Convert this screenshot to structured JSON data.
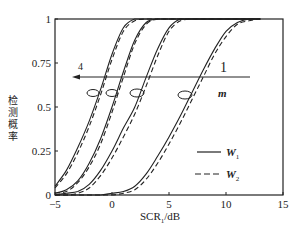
{
  "chart_data": {
    "type": "line",
    "title": "",
    "xlabel": "SCR_1/dB",
    "xlabel_main": "SCR",
    "xlabel_sub": "1",
    "xlabel_unit": "/dB",
    "ylabel": "检测概率",
    "xlim": [
      -5,
      15
    ],
    "ylim": [
      0,
      1
    ],
    "xticks": [
      -5,
      0,
      5,
      10,
      15
    ],
    "xtick_labels": [
      "−5",
      "0",
      "5",
      "10",
      "15"
    ],
    "yticks": [
      0,
      0.25,
      0.5,
      0.75,
      1
    ],
    "ytick_labels": [
      "0",
      "0.25",
      "0.5",
      "0.75",
      "1"
    ],
    "grid": false,
    "legend_position": "lower right inside",
    "legend": [
      {
        "label": "W",
        "sub": "1",
        "style": "solid"
      },
      {
        "label": "W",
        "sub": "2",
        "style": "dashed"
      }
    ],
    "annotations": {
      "arrow_start_label": "1",
      "arrow_end_label": "4",
      "arrow_variable": "m",
      "arrow_y": 0.67,
      "arrow_direction": "right-to-left",
      "ellipse_y": 0.58
    },
    "x": [
      -5,
      -4,
      -3,
      -2,
      -1,
      0,
      1,
      2,
      3,
      4,
      5,
      6,
      7,
      8,
      9,
      10,
      11,
      12,
      13
    ],
    "series": [
      {
        "name": "W1 m=1",
        "style": "solid",
        "midpoint": 6.5,
        "values": [
          0,
          0,
          0,
          0,
          0,
          0.01,
          0.02,
          0.05,
          0.12,
          0.22,
          0.33,
          0.45,
          0.58,
          0.71,
          0.83,
          0.93,
          0.98,
          1.0,
          1.0
        ]
      },
      {
        "name": "W2 m=1",
        "style": "dashed",
        "midpoint": 6.9,
        "values": [
          0,
          0,
          0,
          0,
          0,
          0,
          0.01,
          0.03,
          0.09,
          0.18,
          0.29,
          0.41,
          0.54,
          0.67,
          0.8,
          0.9,
          0.97,
          0.99,
          1.0
        ]
      },
      {
        "name": "W1 m=2",
        "style": "solid",
        "midpoint": 2.5,
        "values": [
          0,
          0.01,
          0.02,
          0.06,
          0.14,
          0.25,
          0.38,
          0.5,
          0.67,
          0.83,
          0.95,
          1.0,
          1.0,
          1.0,
          1.0,
          1.0,
          1.0,
          1.0,
          1.0
        ]
      },
      {
        "name": "W2 m=2",
        "style": "dashed",
        "midpoint": 2.8,
        "values": [
          0,
          0,
          0.01,
          0.04,
          0.11,
          0.21,
          0.33,
          0.46,
          0.62,
          0.79,
          0.93,
          0.99,
          1.0,
          1.0,
          1.0,
          1.0,
          1.0,
          1.0,
          1.0
        ]
      },
      {
        "name": "W1 m=3",
        "style": "solid",
        "midpoint": 0.0,
        "values": [
          0.01,
          0.03,
          0.08,
          0.18,
          0.32,
          0.5,
          0.7,
          0.88,
          0.98,
          1.0,
          1.0,
          1.0,
          1.0,
          1.0,
          1.0,
          1.0,
          1.0,
          1.0,
          1.0
        ]
      },
      {
        "name": "W2 m=3",
        "style": "dashed",
        "midpoint": 0.2,
        "values": [
          0.01,
          0.02,
          0.07,
          0.16,
          0.29,
          0.47,
          0.67,
          0.86,
          0.97,
          1.0,
          1.0,
          1.0,
          1.0,
          1.0,
          1.0,
          1.0,
          1.0,
          1.0,
          1.0
        ]
      },
      {
        "name": "W1 m=4",
        "style": "solid",
        "midpoint": -1.7,
        "values": [
          0.05,
          0.14,
          0.27,
          0.42,
          0.6,
          0.8,
          0.95,
          1.0,
          1.0,
          1.0,
          1.0,
          1.0,
          1.0,
          1.0,
          1.0,
          1.0,
          1.0,
          1.0,
          1.0
        ]
      },
      {
        "name": "W2 m=4",
        "style": "dashed",
        "midpoint": -1.5,
        "values": [
          0.04,
          0.12,
          0.24,
          0.39,
          0.57,
          0.77,
          0.93,
          0.99,
          1.0,
          1.0,
          1.0,
          1.0,
          1.0,
          1.0,
          1.0,
          1.0,
          1.0,
          1.0,
          1.0
        ]
      }
    ]
  }
}
